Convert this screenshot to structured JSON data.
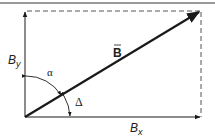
{
  "diagram": {
    "colors": {
      "line": "#1a1a1a",
      "dashed": "#555555",
      "rule": "#9a9a9a"
    },
    "labels": {
      "vector": "B",
      "x_component": "B",
      "x_subscript": "x",
      "y_component": "B",
      "y_subscript": "y",
      "angle_alpha": "α",
      "angle_delta": "Δ"
    },
    "geometry": {
      "origin": [
        25,
        117
      ],
      "x_axis_end": [
        201,
        117
      ],
      "y_axis_end": [
        25,
        11
      ],
      "vector_tip": [
        201,
        11
      ]
    }
  }
}
